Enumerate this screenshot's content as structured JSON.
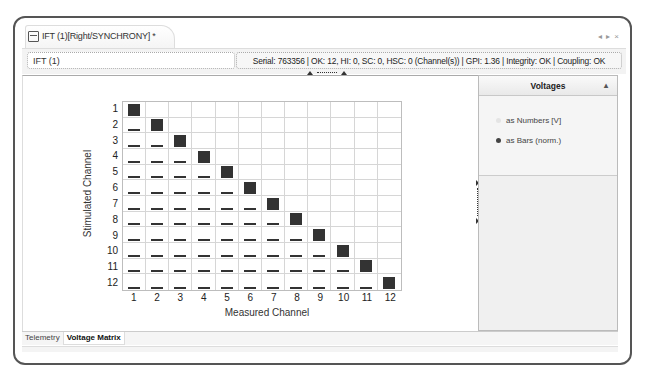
{
  "window": {
    "tab_title": "IFT (1)[Right/SYNCHRONY] *",
    "controls": [
      "◂",
      "▸",
      "×"
    ]
  },
  "header": {
    "identifier": "IFT (1)",
    "status": "Serial: 763356 | OK: 12, HI: 0, SC: 0, HSC: 0 (Channel(s)) | GPI: 1.36 | Integrity: OK | Coupling: OK"
  },
  "voltages_panel": {
    "title": "Voltages",
    "collapse_icon": "▴",
    "options": [
      {
        "label": "as Numbers [V]",
        "selected": false
      },
      {
        "label": "as Bars (norm.)",
        "selected": true
      }
    ]
  },
  "bottom_tabs": [
    {
      "label": "Telemetry",
      "active": false
    },
    {
      "label": "Voltage Matrix",
      "active": true
    }
  ],
  "chart_data": {
    "type": "heatmap",
    "title": "",
    "xlabel": "Measured Channel",
    "ylabel": "Stimulated Channel",
    "x_ticks": [
      "1",
      "2",
      "3",
      "4",
      "5",
      "6",
      "7",
      "8",
      "9",
      "10",
      "11",
      "12"
    ],
    "y_ticks": [
      "1",
      "2",
      "3",
      "4",
      "5",
      "6",
      "7",
      "8",
      "9",
      "10",
      "11",
      "12"
    ],
    "grid": true,
    "diagonal_value": 1.0,
    "lower_triangle_value": 0.15,
    "upper_triangle_value": 0
  }
}
